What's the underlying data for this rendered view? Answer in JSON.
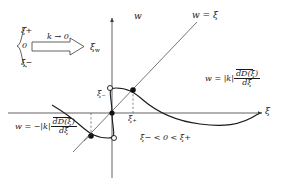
{
  "figure": {
    "domain": "diagram",
    "background": "#ffffff",
    "stroke": "#3a3a3a",
    "text_color": "#1a1a1a",
    "width": 285,
    "height": 186
  },
  "axes": {
    "vertical_label": "w",
    "horizontal_label": "ξ",
    "origin": {
      "x": 112,
      "y": 113
    },
    "x_range": [
      86,
      268
    ],
    "y_range": [
      18,
      178
    ]
  },
  "curves": [
    {
      "name": "identity-line",
      "label": "w = ξ",
      "label_x": 193,
      "label_y": 12,
      "style": "thin solid diagonal"
    },
    {
      "name": "upper-dispersion-branch",
      "label_parts": {
        "lhs": "w = ",
        "k": "|k|",
        "num": "dD̄(ξ)",
        "den": "dξ"
      },
      "label_x": 206,
      "label_y": 72,
      "style": "solid curve"
    },
    {
      "name": "lower-dispersion-branch",
      "label_parts": {
        "lhs": "w = −",
        "k": "|k|",
        "num": "dD̄(ξ)",
        "den": "dξ"
      },
      "label_x": 16,
      "label_y": 120,
      "style": "solid curve"
    }
  ],
  "markers": {
    "filled_points": [
      {
        "name": "origin-point",
        "x": 112,
        "y": 113
      },
      {
        "name": "xi-plus-intersection",
        "x": 133,
        "y": 90
      },
      {
        "name": "xi-minus-intersection",
        "x": 91,
        "y": 136
      }
    ],
    "open_points": [
      {
        "name": "upper-extremum",
        "x": 110,
        "y": 88
      },
      {
        "name": "lower-extremum",
        "x": 114,
        "y": 138
      }
    ]
  },
  "annotations": {
    "xi_minus_axis": {
      "text": "ξ",
      "sub": "−",
      "x": 99,
      "y": 95
    },
    "xi_plus_axis": {
      "text": "ξ",
      "sub": "+",
      "x": 130,
      "y": 116
    },
    "inequality": {
      "text": "ξ− < 0 < ξ+",
      "x": 142,
      "y": 139
    }
  },
  "inset": {
    "name": "limit-arrow-inset",
    "brace_values": [
      "ξ+",
      "0",
      "ξ−"
    ],
    "arrow_label": "k → 0",
    "arrow_label_x": 54,
    "arrow_label_y": 40,
    "target_label": "ξ",
    "target_sub": "w",
    "target_x": 92,
    "target_y": 55
  }
}
